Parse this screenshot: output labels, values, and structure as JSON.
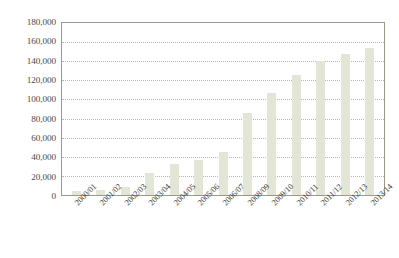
{
  "chart_data": {
    "type": "bar",
    "title": "",
    "subtitle": "",
    "xlabel": "",
    "ylabel": "",
    "legend": [],
    "legend_position": "none",
    "grid": true,
    "grid_style": "dotted horizontal",
    "ylim": [
      0,
      180000
    ],
    "ytick_step": 20000,
    "ytick_labels": [
      "180,000",
      "160,000",
      "140,000",
      "120,000",
      "100,000",
      "80,000",
      "60,000",
      "40,000",
      "20,000",
      "0"
    ],
    "ytick_values": [
      180000,
      160000,
      140000,
      120000,
      100000,
      80000,
      60000,
      40000,
      20000,
      0
    ],
    "categories": [
      "2000/01",
      "2001/02",
      "2002/03",
      "2003/04",
      "2004/05",
      "2005/06",
      "2006/07",
      "2008/09",
      "2009/10",
      "2010/11",
      "2011/12",
      "2012/13",
      "2013/14"
    ],
    "values": [
      4000,
      5500,
      8500,
      23000,
      32000,
      37000,
      45000,
      86000,
      107000,
      126000,
      140000,
      148000,
      154000
    ],
    "bar_color": "#e3e6d6",
    "axis_color": "#9a9a86",
    "grid_color": "#b9b9a8",
    "text_color": "#3a3a3a",
    "background": "#ffffff"
  }
}
